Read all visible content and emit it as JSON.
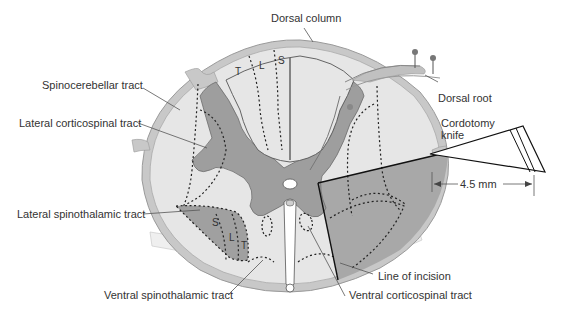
{
  "figure": {
    "colors": {
      "white_matter": "#e6e6e6",
      "gray_matter": "#9e9e9e",
      "pia_outline": "#bdbdbd",
      "incision_region": "#a8a8a8",
      "line": "#222222",
      "text": "#333333"
    }
  },
  "labels": {
    "dorsal_column": "Dorsal column",
    "spinocerebellar_tract": "Spinocerebellar tract",
    "lateral_corticospinal_tract": "Lateral corticospinal tract",
    "dorsal_root": "Dorsal root",
    "cordotomy_knife": "Cordotomy knife",
    "cordotomy_knife_line1": "Cordotomy",
    "cordotomy_knife_line2": "knife",
    "lateral_spinothalamic_tract": "Lateral spinothalamic tract",
    "ventral_spinothalamic_tract": "Ventral spinothalamic tract",
    "line_of_incision": "Line of incision",
    "ventral_corticospinal_tract": "Ventral corticospinal tract",
    "measurement": "4.5 mm"
  },
  "somatotopy": {
    "dorsal_column": [
      "T",
      "L",
      "S"
    ],
    "lateral_spinothalamic": [
      "S",
      "L",
      "T"
    ]
  }
}
